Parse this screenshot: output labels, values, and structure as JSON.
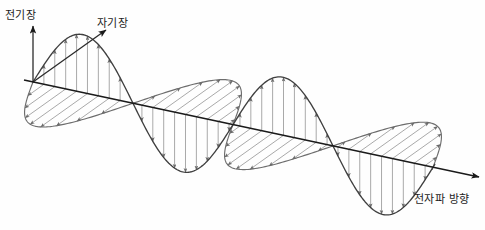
{
  "figure": {
    "background_color": "#ffffff",
    "width": 485,
    "height": 230
  },
  "labels": {
    "electric_field": "전기장",
    "magnetic_field": "자기장",
    "propagation": "전자파 방향"
  },
  "axes": {
    "electric_axis": {
      "name": "vertical-axis",
      "from": [
        33,
        82
      ],
      "to": [
        33,
        26
      ],
      "color": "#2b2b2b"
    },
    "magnetic_axis": {
      "name": "diagonal-axis",
      "from": [
        33,
        82
      ],
      "to": [
        106,
        30
      ],
      "color": "#2b2b2b"
    },
    "propagation_axis": {
      "name": "horizontal-axis",
      "from": [
        24,
        80
      ],
      "to": [
        479,
        177
      ],
      "color": "#1a1a1a"
    }
  },
  "chart_data": {
    "type": "line",
    "xlabel": "전자파 방향",
    "ylabel": "전기장 / 자기장",
    "grid": false,
    "legend": [
      "전기장",
      "자기장"
    ],
    "legend_position": "inline-annotations",
    "axis_origin": [
      33,
      82
    ],
    "axis_end": [
      479,
      177
    ],
    "axis_slope_deg": 12,
    "wave_start_x": 33,
    "wave_end_x": 436,
    "cycles": 2,
    "half_period_px": 100,
    "zero_crossings_x": [
      33,
      125,
      226,
      327,
      428
    ],
    "amplitude_px": 58,
    "series": [
      {
        "name": "전기장",
        "plane": "vertical",
        "phase_deg": 0,
        "arrow_direction": "vertical",
        "color": "#3f3f3f",
        "arrow_color": "#9a9a9a",
        "arrow_count": 36,
        "peaks": [
          {
            "x": 79,
            "value": 1
          },
          {
            "x": 176,
            "value": -1
          },
          {
            "x": 277,
            "value": 1
          },
          {
            "x": 378,
            "value": -1
          }
        ]
      },
      {
        "name": "자기장",
        "plane": "diagonal",
        "phase_deg": 180,
        "arrow_direction": "diagonal",
        "color": "#6d6d6d",
        "arrow_color": "#9a9a9a",
        "arrow_count": 36,
        "peaks": [
          {
            "x": 79,
            "value": -1
          },
          {
            "x": 176,
            "value": 1
          },
          {
            "x": 277,
            "value": -1
          },
          {
            "x": 378,
            "value": 1
          }
        ]
      }
    ]
  }
}
